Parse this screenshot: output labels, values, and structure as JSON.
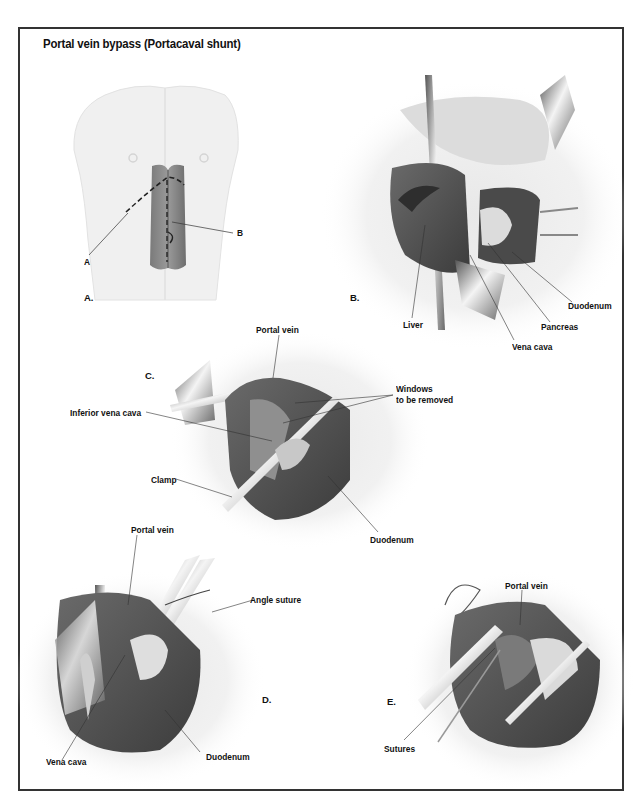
{
  "title": "Portal vein bypass (Portacaval shunt)",
  "panels": {
    "a": {
      "letter": "A.",
      "labels": {
        "incision_a": "A",
        "incision_b": "B"
      }
    },
    "b": {
      "letter": "B.",
      "labels": {
        "liver": "Liver",
        "vena_cava": "Vena cava",
        "pancreas": "Pancreas",
        "duodenum": "Duodenum"
      }
    },
    "c": {
      "letter": "C.",
      "labels": {
        "portal_vein": "Portal vein",
        "windows_line1": "Windows",
        "windows_line2": "to be removed",
        "inferior_vena_cava": "Inferior vena cava",
        "clamp": "Clamp",
        "duodenum": "Duodenum"
      }
    },
    "d": {
      "letter": "D.",
      "labels": {
        "portal_vein": "Portal vein",
        "angle_suture": "Angle suture",
        "vena_cava": "Vena cava",
        "duodenum": "Duodenum"
      }
    },
    "e": {
      "letter": "E.",
      "labels": {
        "portal_vein": "Portal vein",
        "sutures": "Sutures"
      }
    }
  },
  "colors": {
    "frame": "#333333",
    "tissue_dark": "#4a4a4a",
    "tissue_mid": "#8a8a8a",
    "tissue_light": "#e6e6e6",
    "label": "#111111"
  }
}
